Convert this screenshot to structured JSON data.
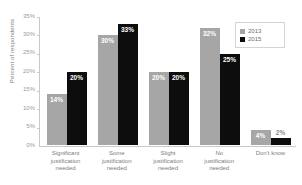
{
  "chart_data": {
    "type": "bar",
    "title": "",
    "xlabel": "",
    "ylabel": "Percent of respondents",
    "ylim": [
      0,
      35
    ],
    "ytick_labels": [
      "35%",
      "30%",
      "25%",
      "20%",
      "15%",
      "10%",
      "5%",
      "0%"
    ],
    "ytick_values": [
      35,
      30,
      25,
      20,
      15,
      10,
      5,
      0
    ],
    "grid": false,
    "legend_position": "top-right",
    "categories": [
      "Significant\njustification\nneeded",
      "Some\njustification\nneeded",
      "Slight\njustification\nneeded",
      "No\njustification\nneeded",
      "Don't know"
    ],
    "series": [
      {
        "name": "2013",
        "color": "#a6a6a6",
        "values": [
          14,
          30,
          20,
          32,
          4
        ],
        "labels": [
          "14%",
          "30%",
          "20%",
          "32%",
          "4%"
        ]
      },
      {
        "name": "2015",
        "color": "#0d0d0d",
        "values": [
          20,
          33,
          20,
          25,
          2
        ],
        "labels": [
          "20%",
          "33%",
          "20%",
          "25%",
          "2%"
        ]
      }
    ]
  },
  "legend": {
    "items": [
      {
        "label": "2013",
        "color": "#a6a6a6"
      },
      {
        "label": "2015",
        "color": "#0d0d0d"
      }
    ]
  }
}
